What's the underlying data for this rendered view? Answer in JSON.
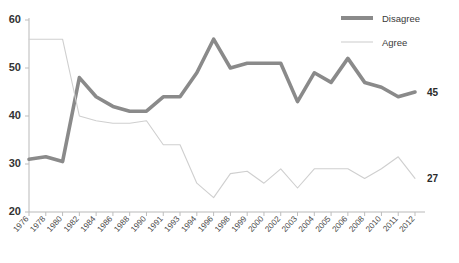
{
  "chart_data": {
    "type": "line",
    "title": "",
    "xlabel": "",
    "ylabel": "",
    "ylim": [
      20,
      60
    ],
    "yticks": [
      20,
      30,
      40,
      50,
      60
    ],
    "grid": false,
    "legend_position": "top-right",
    "categories": [
      "1976",
      "1978",
      "1980",
      "1982",
      "1984",
      "1986",
      "1988",
      "1990",
      "1991",
      "1993",
      "1994",
      "1996",
      "1998",
      "1999",
      "2000",
      "2002",
      "2003",
      "2004",
      "2005",
      "2006",
      "2008",
      "2010",
      "2011",
      "2012"
    ],
    "x": [
      1976,
      1978,
      1980,
      1982,
      1984,
      1986,
      1988,
      1990,
      1991,
      1993,
      1994,
      1996,
      1998,
      1999,
      2000,
      2002,
      2003,
      2004,
      2005,
      2006,
      2008,
      2010,
      2011,
      2012
    ],
    "series": [
      {
        "name": "Disagree",
        "color": "#8a8a8a",
        "end_label": "45",
        "values": [
          31,
          31.5,
          30.5,
          48,
          44,
          42,
          41,
          41,
          44,
          44,
          49,
          56,
          50,
          51,
          51,
          51,
          43,
          49,
          47,
          52,
          47,
          46,
          44,
          45
        ]
      },
      {
        "name": "Agree",
        "color": "#cfcfcf",
        "end_label": "27",
        "values": [
          56,
          56,
          56,
          40,
          39,
          38.5,
          38.5,
          39,
          34,
          34,
          26,
          23,
          28,
          28.5,
          26,
          29,
          25,
          29,
          29,
          29,
          27,
          29,
          31.5,
          27
        ]
      }
    ],
    "legend": [
      {
        "label": "Disagree",
        "style": "thick",
        "color": "#8a8a8a"
      },
      {
        "label": "Agree",
        "style": "thin",
        "color": "#cfcfcf"
      }
    ]
  }
}
